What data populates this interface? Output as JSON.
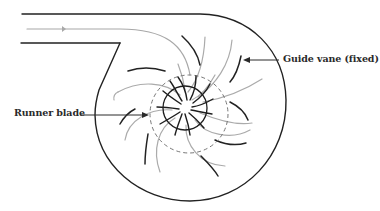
{
  "diagram": {
    "labels": {
      "guide_vane": "Guide vane (fixed)",
      "runner_blade": "Runner blade"
    },
    "colors": {
      "casing": "#222222",
      "guide_vane": "#222222",
      "runner_blade": "#1e1e1e",
      "streamline": "#a8a8a8",
      "dashed_circle": "#777777",
      "label_text": "#2a2a2a",
      "background": "#ffffff"
    },
    "components": [
      "inlet pipe",
      "flow streamline arrow",
      "spiral casing",
      "fixed guide vanes",
      "dashed runner boundary circle",
      "runner blades",
      "runner hub circle"
    ]
  }
}
